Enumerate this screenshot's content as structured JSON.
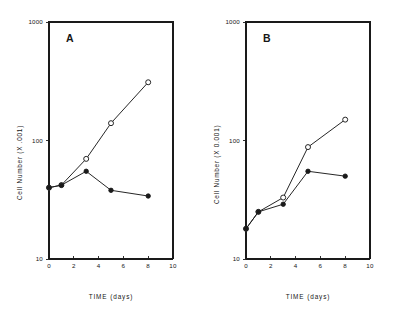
{
  "figure": {
    "panels": [
      {
        "letter": "A",
        "ylabel": "Cell Number (X .001)",
        "xlabel": "TIME (days)"
      },
      {
        "letter": "B",
        "ylabel": "Cell Number (X 0.001)",
        "xlabel": "TIME (days)"
      }
    ],
    "y_tick_labels": [
      "1000",
      "100",
      "10"
    ],
    "x_tick_labels": [
      "0",
      "2",
      "4",
      "6",
      "8",
      "10"
    ]
  },
  "chart_data": [
    {
      "type": "line",
      "title": "A",
      "xlabel": "TIME (days)",
      "ylabel": "Cell Number (X .001)",
      "xlim": [
        0,
        10
      ],
      "ylim": [
        10,
        1000
      ],
      "yscale": "log",
      "xscale": "linear",
      "xticks": [
        0,
        2,
        4,
        6,
        8,
        10
      ],
      "yticks": [
        10,
        100,
        1000
      ],
      "grid": false,
      "legend": "none",
      "series": [
        {
          "name": "open-circle-series",
          "marker": "open-circle",
          "x": [
            0,
            1,
            3,
            5,
            8
          ],
          "values": [
            40,
            42,
            70,
            140,
            310
          ]
        },
        {
          "name": "filled-circle-series",
          "marker": "filled-circle",
          "x": [
            0,
            1,
            3,
            5,
            8
          ],
          "values": [
            40,
            42,
            55,
            38,
            34
          ]
        }
      ]
    },
    {
      "type": "line",
      "title": "B",
      "xlabel": "TIME (days)",
      "ylabel": "Cell Number (X 0.001)",
      "xlim": [
        0,
        10
      ],
      "ylim": [
        10,
        1000
      ],
      "yscale": "log",
      "xscale": "linear",
      "xticks": [
        0,
        2,
        4,
        6,
        8,
        10
      ],
      "yticks": [
        10,
        100,
        1000
      ],
      "grid": false,
      "legend": "none",
      "series": [
        {
          "name": "open-circle-series",
          "marker": "open-circle",
          "x": [
            0,
            1,
            3,
            5,
            8
          ],
          "values": [
            18,
            25,
            33,
            88,
            150
          ]
        },
        {
          "name": "filled-circle-series",
          "marker": "filled-circle",
          "x": [
            0,
            1,
            3,
            5,
            8
          ],
          "values": [
            18,
            25,
            29,
            55,
            50
          ]
        }
      ]
    }
  ]
}
